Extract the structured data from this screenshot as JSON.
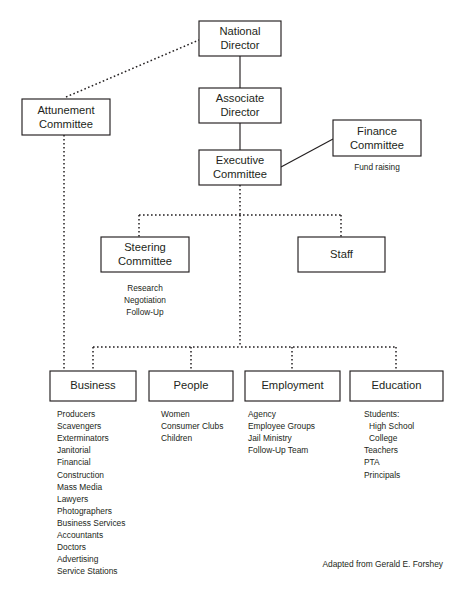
{
  "diagram": {
    "credit": "Adapted from Gerald E. Forshey",
    "colors": {
      "ink": "#231f20",
      "background": "#ffffff"
    },
    "boxes": {
      "national_director": "National\nDirector",
      "national_director_line1": "National",
      "national_director_line2": "Director",
      "associate_director_line1": "Associate",
      "associate_director_line2": "Director",
      "executive_committee_line1": "Executive",
      "executive_committee_line2": "Committee",
      "attunement_committee_line1": "Attunement",
      "attunement_committee_line2": "Committee",
      "finance_committee_line1": "Finance",
      "finance_committee_line2": "Committee",
      "steering_committee_line1": "Steering",
      "steering_committee_line2": "Committee",
      "staff": "Staff",
      "business": "Business",
      "people": "People",
      "employment": "Employment",
      "education": "Education"
    },
    "captions": {
      "finance_note": "Fund raising",
      "steering_notes": [
        "Research",
        "Negotiation",
        "Follow-Up"
      ]
    },
    "columns": {
      "business": [
        "Producers",
        "Scavengers",
        "Exterminators",
        "Janitorial",
        "Financial",
        "Construction",
        "Mass Media",
        "Lawyers",
        "Photographers",
        "Business Services",
        "Accountants",
        "Doctors",
        "Advertising",
        "Service Stations"
      ],
      "people": [
        "Women",
        "Consumer Clubs",
        "Children"
      ],
      "employment": [
        "Agency",
        "Employee Groups",
        "Jail Ministry",
        "Follow-Up Team"
      ],
      "education": [
        "Students:",
        "High School",
        "College",
        "Teachers",
        "PTA",
        "Principals"
      ],
      "education_indented": [
        false,
        true,
        true,
        false,
        false,
        false
      ]
    }
  }
}
